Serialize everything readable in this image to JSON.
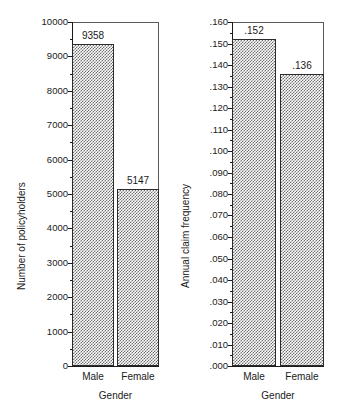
{
  "figure": {
    "background": "#ffffff",
    "ink": "#1a1a1a",
    "frame_color": "#5a5a5a",
    "bar_fill": "#6e6e6e",
    "bar_edge": "#2b2b2b"
  },
  "chart_data": [
    {
      "type": "bar",
      "panel": "left",
      "title": "",
      "categories": [
        "Male",
        "Female"
      ],
      "values": [
        9358,
        5147
      ],
      "data_labels": [
        "9358",
        "5147"
      ],
      "xlabel": "Gender",
      "ylabel": "Number of policyholders",
      "ylim": [
        0,
        10000
      ],
      "ytick_values": [
        0,
        1000,
        2000,
        3000,
        4000,
        5000,
        6000,
        7000,
        8000,
        9000,
        10000
      ],
      "ytick_labels": [
        "0",
        "1000",
        "2000",
        "3000",
        "4000",
        "5000",
        "6000",
        "7000",
        "8000",
        "9000",
        "10000"
      ],
      "grid": false,
      "legend": "none"
    },
    {
      "type": "bar",
      "panel": "right",
      "title": "",
      "categories": [
        "Male",
        "Female"
      ],
      "values": [
        0.152,
        0.136
      ],
      "data_labels": [
        ".152",
        ".136"
      ],
      "xlabel": "Gender",
      "ylabel": "Annual claim frequency",
      "ylim": [
        0,
        0.16
      ],
      "ytick_values": [
        0,
        0.01,
        0.02,
        0.03,
        0.04,
        0.05,
        0.06,
        0.07,
        0.08,
        0.09,
        0.1,
        0.11,
        0.12,
        0.13,
        0.14,
        0.15,
        0.16
      ],
      "ytick_labels": [
        ".000",
        ".010",
        ".020",
        ".030",
        ".040",
        ".050",
        ".060",
        ".070",
        ".080",
        ".090",
        ".100",
        ".110",
        ".120",
        ".130",
        ".140",
        ".150",
        ".160"
      ],
      "grid": false,
      "legend": "none"
    }
  ]
}
